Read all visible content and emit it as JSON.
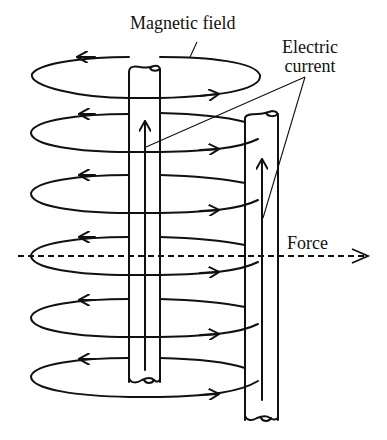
{
  "diagram": {
    "labels": {
      "magnetic_field": "Magnetic field",
      "electric_current_line1": "Electric",
      "electric_current_line2": "current",
      "force": "Force"
    },
    "elements": {
      "conductors": [
        {
          "name": "left-wire",
          "x_left": 129,
          "x_right": 160,
          "top": 67,
          "bottom": 382,
          "current_direction": "up"
        },
        {
          "name": "right-wire",
          "x_left": 245,
          "x_right": 278,
          "top": 115,
          "bottom": 420,
          "current_direction": "up"
        }
      ],
      "field_loops": [
        {
          "cy": 79,
          "direction": "counterclockwise-view"
        },
        {
          "cy": 130
        },
        {
          "cy": 190
        },
        {
          "cy": 253
        },
        {
          "cy": 313
        },
        {
          "cy": 372
        }
      ],
      "force_axis": {
        "y": 256,
        "x_start": 18,
        "x_end": 372,
        "style": "dashed",
        "arrow": "right"
      }
    },
    "colors": {
      "line": "#111111",
      "background": "#ffffff"
    }
  }
}
